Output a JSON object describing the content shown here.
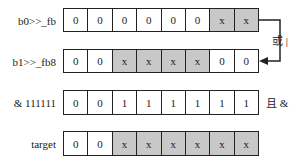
{
  "rows": [
    {
      "label": "b0>>_fb",
      "cells": [
        "0",
        "0",
        "0",
        "0",
        "0",
        "0",
        "x",
        "x"
      ],
      "shaded": [
        false,
        false,
        false,
        false,
        false,
        false,
        true,
        true
      ]
    },
    {
      "label": "b1>>_fb8",
      "cells": [
        "0",
        "0",
        "x",
        "x",
        "x",
        "x",
        "0",
        "0"
      ],
      "shaded": [
        false,
        false,
        true,
        true,
        true,
        true,
        false,
        false
      ]
    },
    {
      "label": "& 111111",
      "cells": [
        "0",
        "0",
        "1",
        "1",
        "1",
        "1",
        "1",
        "1"
      ],
      "shaded": [
        false,
        false,
        false,
        false,
        false,
        false,
        false,
        false
      ]
    },
    {
      "label": "target",
      "cells": [
        "0",
        "0",
        "x",
        "x",
        "x",
        "x",
        "x",
        "x"
      ],
      "shaded": [
        false,
        false,
        true,
        true,
        true,
        true,
        true,
        true
      ]
    }
  ],
  "operators": {
    "or_label": "或 |",
    "and_label": "且 &"
  },
  "colors": {
    "shaded": "#c8c8c8",
    "border": "#222222"
  }
}
